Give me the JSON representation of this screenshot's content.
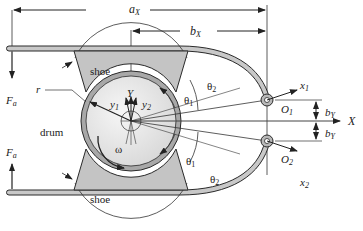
{
  "diagram": {
    "colors": {
      "line": "#2a2a2a",
      "arm_fill": "#c8c8c8",
      "shoe_fill": "#c4c4c4",
      "drum_rim": "#a8a8a8",
      "drum_face": "#e8e8e8",
      "background": "#ffffff"
    },
    "labels": {
      "ax": "a",
      "ax_sub": "X",
      "bx": "b",
      "bx_sub": "X",
      "shoe_top": "shoe",
      "shoe_bottom": "shoe",
      "drum": "drum",
      "r": "r",
      "Y": "Y",
      "y1": "y",
      "y1_sub": "1",
      "y2": "y",
      "y2_sub": "2",
      "omega": "ω",
      "theta1_top": "θ",
      "theta1_top_sub": "1",
      "theta2_top": "θ",
      "theta2_top_sub": "2",
      "theta1_bottom": "θ",
      "theta1_bottom_sub": "1",
      "theta2_bottom": "θ",
      "theta2_bottom_sub": "2",
      "Fa_top": "F",
      "Fa_top_sub": "a",
      "Fa_bottom": "F",
      "Fa_bottom_sub": "a",
      "O1": "O",
      "O1_sub": "1",
      "O2": "O",
      "O2_sub": "2",
      "x1": "x",
      "x1_sub": "1",
      "x2": "x",
      "x2_sub": "2",
      "X": "X",
      "bY_top": "b",
      "bY_top_sub": "Y",
      "bY_bottom": "b",
      "bY_bottom_sub": "Y"
    }
  }
}
